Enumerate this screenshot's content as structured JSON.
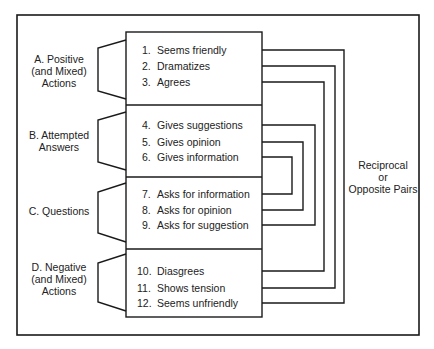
{
  "groups": [
    {
      "id": "A",
      "label_lines": [
        "A. Positive",
        "(and Mixed)",
        "Actions"
      ]
    },
    {
      "id": "B",
      "label_lines": [
        "B. Attempted",
        "Answers"
      ]
    },
    {
      "id": "C",
      "label_lines": [
        "C. Questions"
      ]
    },
    {
      "id": "D",
      "label_lines": [
        "D. Negative",
        "(and Mixed)",
        "Actions"
      ]
    }
  ],
  "items": [
    {
      "num": "1.",
      "text": "Seems friendly"
    },
    {
      "num": "2.",
      "text": "Dramatizes"
    },
    {
      "num": "3.",
      "text": "Agrees"
    },
    {
      "num": "4.",
      "text": "Gives suggestions"
    },
    {
      "num": "5.",
      "text": "Gives opinion"
    },
    {
      "num": "6.",
      "text": "Gives information"
    },
    {
      "num": "7.",
      "text": "Asks for information"
    },
    {
      "num": "8.",
      "text": "Asks for opinion"
    },
    {
      "num": "9.",
      "text": "Asks for suggestion"
    },
    {
      "num": "10.",
      "text": "Diasgrees"
    },
    {
      "num": "11.",
      "text": "Shows tension"
    },
    {
      "num": "12.",
      "text": "Seems unfriendly"
    }
  ],
  "pairs": [
    [
      1,
      12
    ],
    [
      2,
      11
    ],
    [
      3,
      10
    ],
    [
      4,
      9
    ],
    [
      5,
      8
    ],
    [
      6,
      7
    ]
  ],
  "right_label": {
    "lines": [
      "Reciprocal",
      "or",
      "Opposite Pairs"
    ]
  }
}
